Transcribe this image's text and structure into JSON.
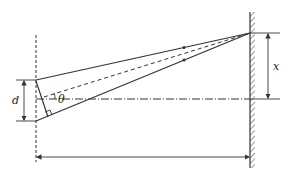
{
  "diagram": {
    "labels": {
      "slit_separation": "d",
      "angle": "θ",
      "screen_offset": "x"
    },
    "colors": {
      "line": "#333333",
      "background": "#ffffff"
    }
  }
}
